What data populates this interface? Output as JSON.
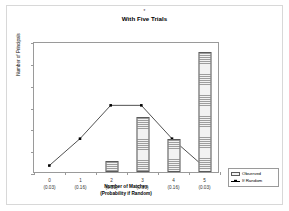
{
  "chart_data": {
    "type": "bar",
    "title": "With Five Trials",
    "title_mark": "*",
    "xlabel_line1": "Number of Matches",
    "xlabel_line2": "(Probability if Random)",
    "ylabel": "Number of Principals",
    "categories": [
      "0",
      "1",
      "2",
      "3",
      "4",
      "5"
    ],
    "category_sublabels": [
      "(0.03)",
      "(0.16)",
      "(0.31)",
      "(0.31)",
      "(0.16)",
      "(0.03)"
    ],
    "ylim": [
      0,
      12
    ],
    "yticks": [
      "0",
      "2",
      "4",
      "6",
      "8",
      "10",
      "12"
    ],
    "ytick_values": [
      0,
      2,
      4,
      6,
      8,
      10,
      12
    ],
    "grid": false,
    "legend_position": "bottom-right-outside",
    "series": [
      {
        "name": "Observed",
        "render": "bar",
        "values": [
          0,
          0,
          1,
          5,
          3,
          11
        ]
      },
      {
        "name": "If Random",
        "render": "line-marker",
        "values": [
          0.6,
          3.1,
          6.2,
          6.2,
          3.1,
          0.6
        ]
      }
    ]
  },
  "legend": {
    "items": [
      {
        "label": "Observed",
        "swatch": "hatched-bar-swatch"
      },
      {
        "label": "If Random",
        "swatch": "line-marker-swatch"
      }
    ]
  },
  "colors": {
    "axis": "#9a9a9a",
    "bar_edge": "#5a5a5a",
    "bar_hatch": "#9d9d9d",
    "line": "#000000",
    "page_frame": "#d8d8d8",
    "text": "#000000"
  }
}
